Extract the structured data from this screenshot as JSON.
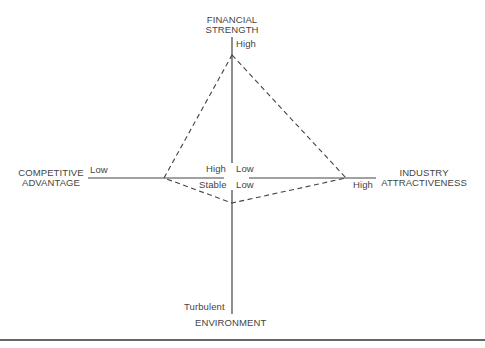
{
  "diagram": {
    "type": "strategic-position-action-evaluation",
    "axes": {
      "top": {
        "title_line1": "FINANCIAL",
        "title_line2": "STRENGTH",
        "end_label": "High",
        "center_label": "Low"
      },
      "left": {
        "title_line1": "COMPETITIVE",
        "title_line2": "ADVANTAGE",
        "end_label": "Low",
        "center_label": "High"
      },
      "right": {
        "title_line1": "INDUSTRY",
        "title_line2": "ATTRACTIVENESS",
        "end_label": "High",
        "center_label": "Low"
      },
      "bottom": {
        "title": "ENVIRONMENT",
        "end_label": "Turbulent",
        "center_label": "Stable"
      }
    },
    "profile_polygon": {
      "style": "dashed",
      "vertices": [
        {
          "axis": "financial-strength",
          "x": 232,
          "y": 55
        },
        {
          "axis": "industry-attractiveness",
          "x": 346,
          "y": 178
        },
        {
          "axis": "environment",
          "x": 232,
          "y": 203
        },
        {
          "axis": "competitive-advantage",
          "x": 164,
          "y": 178
        }
      ]
    },
    "colors": {
      "line": "#444444",
      "text": "#444444"
    }
  }
}
